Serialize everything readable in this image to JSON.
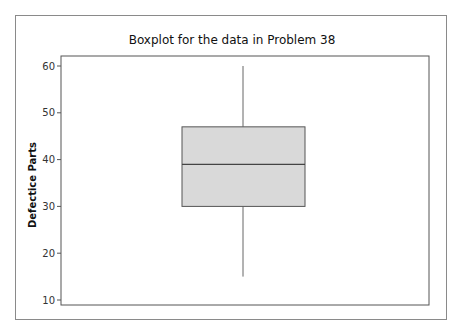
{
  "chart_data": {
    "type": "boxplot",
    "title": "Boxplot for the data in Problem 38",
    "xlabel": "",
    "ylabel": "Defectice Parts",
    "ylim": [
      9.4,
      62
    ],
    "yticks": [
      10,
      20,
      30,
      40,
      50,
      60
    ],
    "grid": false,
    "legend": null,
    "box": {
      "whisker_min": 15,
      "q1": 30,
      "median": 39,
      "q3": 47,
      "whisker_max": 60
    },
    "colors": {
      "box_fill": "#d9d9d9",
      "box_edge": "#555555",
      "whisker": "#666666",
      "axis": "#555555"
    }
  }
}
